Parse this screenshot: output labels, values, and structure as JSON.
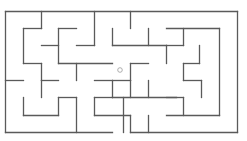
{
  "maze": {
    "width": 247,
    "height": 141,
    "wall_color": "#5a5a5a",
    "background": "#ffffff",
    "marker": {
      "x": 120,
      "y": 70,
      "r": 2.3,
      "color": "#9a9a9a",
      "label": "player-position"
    },
    "walls": [
      [
        5,
        11,
        237,
        11
      ],
      [
        5,
        11,
        5,
        132
      ],
      [
        5,
        132,
        112,
        132
      ],
      [
        130,
        132,
        237,
        132
      ],
      [
        237,
        11,
        237,
        132
      ],
      [
        41,
        11,
        41,
        28
      ],
      [
        23,
        28,
        41,
        28
      ],
      [
        23,
        28,
        23,
        63
      ],
      [
        41,
        45,
        58,
        45
      ],
      [
        58,
        28,
        58,
        63
      ],
      [
        58,
        28,
        76,
        28
      ],
      [
        76,
        45,
        94,
        45
      ],
      [
        94,
        11,
        94,
        45
      ],
      [
        23,
        63,
        41,
        63
      ],
      [
        41,
        63,
        41,
        80
      ],
      [
        58,
        63,
        112,
        63
      ],
      [
        112,
        28,
        112,
        45
      ],
      [
        112,
        11,
        112,
        11
      ],
      [
        130,
        11,
        130,
        28
      ],
      [
        148,
        28,
        148,
        45
      ],
      [
        112,
        45,
        166,
        45
      ],
      [
        166,
        28,
        219,
        28
      ],
      [
        183,
        28,
        183,
        45
      ],
      [
        166,
        45,
        183,
        45
      ],
      [
        166,
        45,
        166,
        63
      ],
      [
        199,
        45,
        199,
        63
      ],
      [
        183,
        63,
        199,
        63
      ],
      [
        183,
        63,
        183,
        80
      ],
      [
        112,
        80,
        130,
        80
      ],
      [
        130,
        63,
        148,
        63
      ],
      [
        130,
        63,
        130,
        80
      ],
      [
        148,
        80,
        148,
        97
      ],
      [
        219,
        28,
        219,
        115
      ],
      [
        5,
        80,
        23,
        80
      ],
      [
        41,
        80,
        58,
        80
      ],
      [
        76,
        63,
        76,
        80
      ],
      [
        41,
        80,
        41,
        97
      ],
      [
        58,
        97,
        76,
        97
      ],
      [
        23,
        97,
        23,
        115
      ],
      [
        23,
        115,
        58,
        115
      ],
      [
        58,
        97,
        58,
        115
      ],
      [
        76,
        97,
        76,
        132
      ],
      [
        94,
        97,
        94,
        115
      ],
      [
        94,
        97,
        112,
        97
      ],
      [
        112,
        80,
        112,
        97
      ],
      [
        94,
        80,
        112,
        80
      ],
      [
        112,
        80,
        112,
        80
      ],
      [
        130,
        80,
        130,
        97
      ],
      [
        112,
        97,
        176,
        97
      ],
      [
        123,
        97,
        123,
        132
      ],
      [
        148,
        97,
        148,
        97
      ],
      [
        166,
        97,
        183,
        97
      ],
      [
        183,
        97,
        183,
        115
      ],
      [
        201,
        80,
        201,
        97
      ],
      [
        166,
        115,
        219,
        115
      ],
      [
        183,
        80,
        201,
        80
      ],
      [
        94,
        115,
        130,
        115
      ],
      [
        130,
        115,
        130,
        132
      ],
      [
        148,
        115,
        148,
        132
      ]
    ]
  }
}
